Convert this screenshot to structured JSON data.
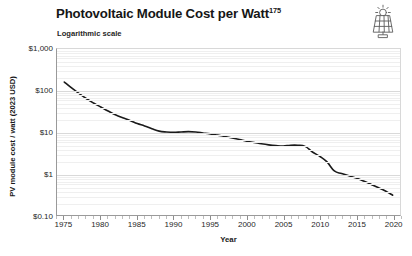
{
  "header": {
    "title": "Photovoltaic Module Cost per Watt",
    "title_superscript": "175",
    "subtitle": "Logarithmic scale",
    "icon": "solar-panel-icon"
  },
  "chart_data": {
    "type": "line",
    "title": "Photovoltaic Module Cost per Watt",
    "subtitle": "Logarithmic scale",
    "xlabel": "Year",
    "ylabel": "PV module cost / watt (2023 USD)",
    "yscale": "log",
    "ylim": [
      0.1,
      1000
    ],
    "xlim": [
      1974,
      2021
    ],
    "grid": true,
    "legend": false,
    "ytick_labels": [
      "$1,000",
      "$100",
      "$10",
      "$1",
      "$0.10"
    ],
    "ytick_values": [
      1000,
      100,
      10,
      1,
      0.1
    ],
    "xtick_labels": [
      "1975",
      "1980",
      "1985",
      "1990",
      "1995",
      "2000",
      "2005",
      "2010",
      "2015",
      "2020"
    ],
    "xtick_values": [
      1975,
      1980,
      1985,
      1990,
      1995,
      2000,
      2005,
      2010,
      2015,
      2020
    ],
    "line_color": "#1a1a1a",
    "series": [
      {
        "name": "PV module cost per watt",
        "x": [
          1975,
          1976,
          1977,
          1978,
          1979,
          1980,
          1981,
          1982,
          1983,
          1984,
          1985,
          1986,
          1987,
          1988,
          1989,
          1990,
          1991,
          1992,
          1993,
          1994,
          1995,
          1996,
          1997,
          1998,
          1999,
          2000,
          2001,
          2002,
          2003,
          2004,
          2005,
          2006,
          2007,
          2008,
          2009,
          2010,
          2011,
          2012,
          2013,
          2014,
          2015,
          2016,
          2017,
          2018,
          2019,
          2020
        ],
        "values": [
          160,
          115,
          85,
          64,
          50,
          40,
          32,
          26,
          22,
          19,
          16,
          14,
          12,
          10.5,
          10,
          9.8,
          10.0,
          10.2,
          10.0,
          9.5,
          9.0,
          8.4,
          7.8,
          7.2,
          6.6,
          6.0,
          5.6,
          5.2,
          4.9,
          4.7,
          4.6,
          4.8,
          4.8,
          4.5,
          3.3,
          2.6,
          1.9,
          1.15,
          1.0,
          0.88,
          0.78,
          0.66,
          0.55,
          0.46,
          0.38,
          0.3
        ]
      }
    ]
  }
}
